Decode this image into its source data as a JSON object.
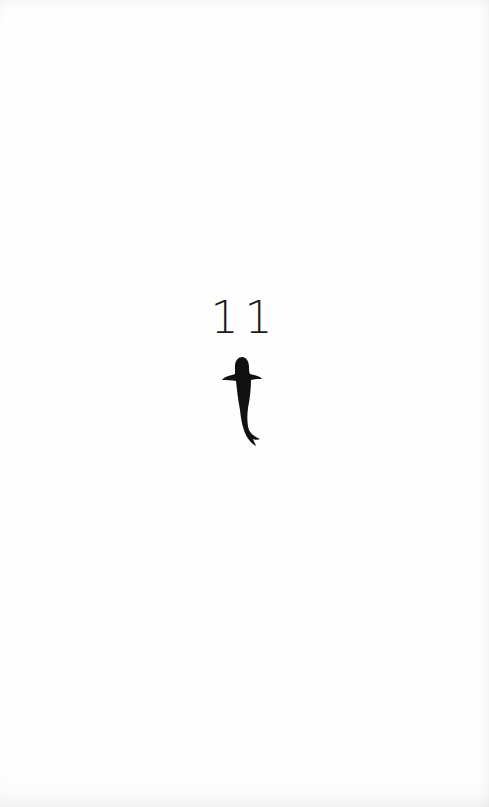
{
  "page": {
    "page_number": "11",
    "illustration": "koi-fish-silhouette-icon",
    "ink_color": "#111111"
  }
}
